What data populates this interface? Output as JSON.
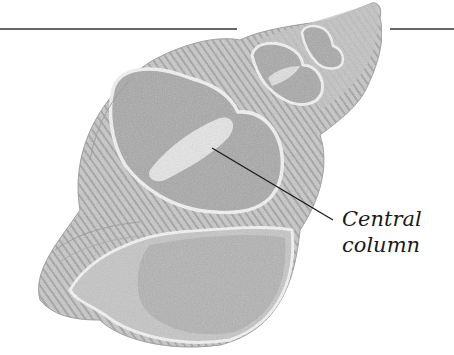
{
  "diagram": {
    "labels": [
      {
        "id": "central-column",
        "lines": [
          "Central",
          "column"
        ]
      }
    ],
    "colors": {
      "background": "#ffffff",
      "shell_texture": "#bdbdbd",
      "shell_dark": "#8c8c8c",
      "chamber_fill": "#a9a9a9",
      "septum_outline": "#f4f4f4",
      "line": "#222222"
    }
  }
}
